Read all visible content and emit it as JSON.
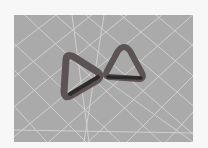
{
  "image": {
    "description": "Photo of two rounded-triangle rings resting on a gray cutting mat with white grid lines",
    "colors": {
      "background": "#f7f7f7",
      "mat": "#a9a9a9",
      "grid": "#d8d8d8",
      "ring": "#5f5555",
      "ring_dark": "#3a3333"
    }
  }
}
